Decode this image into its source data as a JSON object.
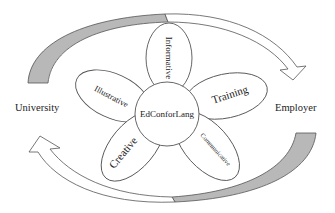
{
  "diagram": {
    "center": {
      "label": "EdConforLang"
    },
    "petals": [
      {
        "id": "informative",
        "label": "Informative"
      },
      {
        "id": "training",
        "label": "Training"
      },
      {
        "id": "communicative",
        "label": "Communicative"
      },
      {
        "id": "creative",
        "label": "Creative"
      },
      {
        "id": "illustrative",
        "label": "Illustrative"
      }
    ],
    "left_node": {
      "label": "University"
    },
    "right_node": {
      "label": "Employer"
    },
    "colors": {
      "stroke": "#555555",
      "arrow_fill_shaded": "#b8b8b8",
      "arrow_fill_open": "#ffffff",
      "background": "#ffffff"
    }
  }
}
